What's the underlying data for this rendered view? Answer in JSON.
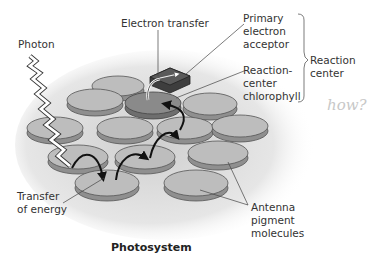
{
  "diagram": {
    "title": "Photosystem",
    "labels": {
      "photon": "Photon",
      "electron_transfer": "Electron transfer",
      "primary_acceptor": [
        "Primary",
        "electron",
        "acceptor"
      ],
      "reaction_center_chlorophyll": [
        "Reaction-",
        "center",
        "chlorophyll"
      ],
      "reaction_center": [
        "Reaction",
        "center"
      ],
      "transfer_of_energy": [
        "Transfer",
        "of energy"
      ],
      "antenna": [
        "Antenna",
        "pigment",
        "molecules"
      ],
      "handwritten_note": "how?"
    },
    "colors": {
      "disk_top": "#bdbdbd",
      "disk_side": "#8f8f8f",
      "reaction_disk_top": "#8a8a8a",
      "acceptor_box": "#5a5a5a",
      "arrow": "#111111",
      "shadow": "#d9d9d9",
      "text": "#333333"
    }
  }
}
